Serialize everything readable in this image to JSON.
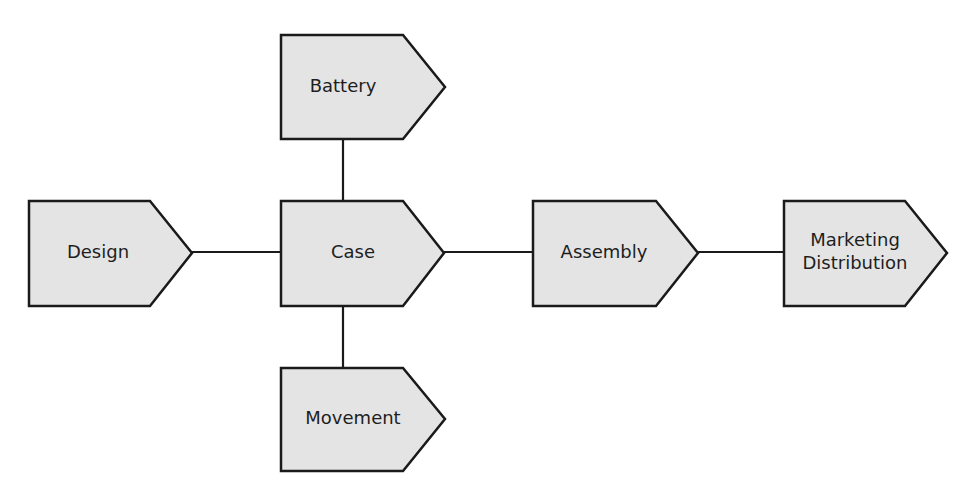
{
  "diagram": {
    "type": "process-flow",
    "colors": {
      "node_fill": "#e4e4e4",
      "stroke": "#1a1a1a",
      "text": "#1e1e1e",
      "background": "#ffffff"
    },
    "nodes": [
      {
        "id": "battery",
        "label": "Battery"
      },
      {
        "id": "design",
        "label": "Design"
      },
      {
        "id": "case",
        "label": "Case"
      },
      {
        "id": "assembly",
        "label": "Assembly"
      },
      {
        "id": "marketing",
        "label_line1": "Marketing",
        "label_line2": "Distribution"
      },
      {
        "id": "movement",
        "label": "Movement"
      }
    ],
    "edges": [
      {
        "from": "battery",
        "to": "case"
      },
      {
        "from": "design",
        "to": "case"
      },
      {
        "from": "movement",
        "to": "case"
      },
      {
        "from": "case",
        "to": "assembly"
      },
      {
        "from": "assembly",
        "to": "marketing"
      }
    ]
  }
}
